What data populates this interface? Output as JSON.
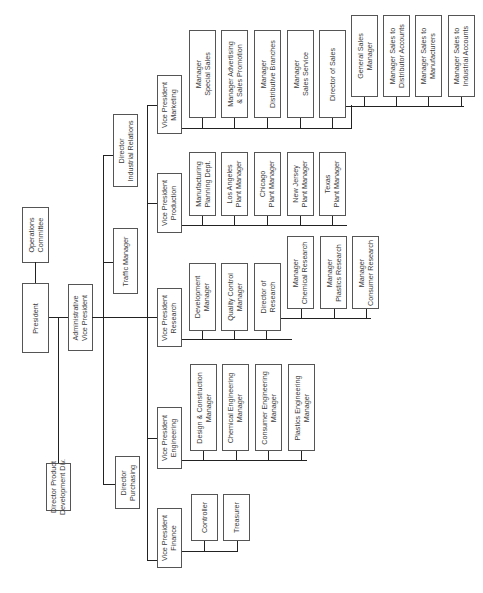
{
  "chart_title": "",
  "orientation": "rotated-90-ccw",
  "nodes": {
    "operations_committee": "Operations\nCommittee",
    "president": "President",
    "admin_vp": "Administrative\nVice President",
    "dir_product_dev": "Director Product\nDevelopment Div.",
    "dir_industrial_relations": "Director\nIndustrial Relations",
    "traffic_manager": "Traffic Manager",
    "dir_purchasing": "Director\nPurchasing",
    "vp_marketing": "Vice President\nMarketing",
    "vp_production": "Vice President\nProduction",
    "vp_research": "Vice President\nResearch",
    "vp_engineering": "Vice President\nEngineering",
    "vp_finance": "Vice President\nFinance"
  },
  "marketing": [
    "Manager\nSpecial Sales",
    "Manager Advertising\n& Sales Promotion",
    "Manager\nDistributive Branches",
    "Manager\nSales Service",
    "Director of Sales"
  ],
  "sales": [
    "General Sales\nManager",
    "Manager Sales to\nDistributor Accounts",
    "Manager Sales to\nManufacturers",
    "Manager Sales to\nIndustrial Accounts"
  ],
  "production": [
    "Manufacturing\nPlanning Dept.",
    "Los Angeles\nPlant Manager",
    "Chicago\nPlant Manager",
    "New Jersey\nPlant Manager",
    "Texas\nPlant Manager"
  ],
  "research": [
    "Development\nManager",
    "Quality Control\nManager",
    "Director of\nResearch"
  ],
  "research_sub": [
    "Manager\nChemical Research",
    "Manager\nPlastics Research",
    "Manager\nConsumer Research"
  ],
  "engineering": [
    "Design & Construction\nManager",
    "Chemical Engineering\nManager",
    "Consumer Engineering\nManager",
    "Plastics Engineering\nManager"
  ],
  "finance": [
    "Controller",
    "Treasurer"
  ]
}
